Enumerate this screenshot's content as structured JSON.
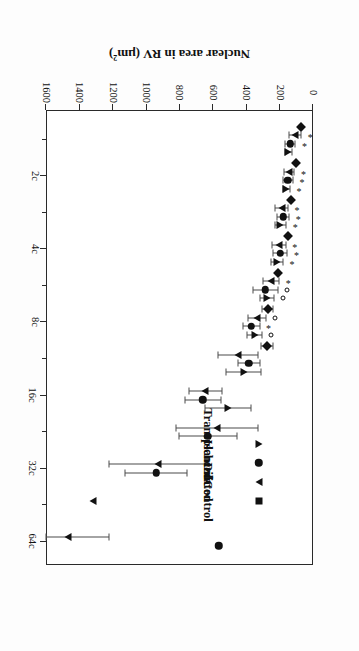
{
  "chart_data": {
    "type": "scatter",
    "title": "",
    "xlabel": "",
    "ylabel": "Nuclear area in RV (µm²)",
    "ylabel_html": "Nuclear area in RV (µm<sup>2</sup>)",
    "orientation": "figure printed rotated 180 degrees",
    "grid": false,
    "legend_position": "upper-left (in rotated frame)",
    "ylim": [
      0,
      1600
    ],
    "yticks": [
      0,
      200,
      400,
      600,
      800,
      1000,
      1200,
      1400,
      1600
    ],
    "ytick_labels": [
      "0",
      "200",
      "400",
      "600",
      "800",
      "1000",
      "1200",
      "1400",
      "1600"
    ],
    "xtick_labels": [
      "2c",
      "4c",
      "8c",
      "16c",
      "32c",
      "64c"
    ],
    "xtick_positions": [
      2,
      4,
      8,
      16,
      32,
      64
    ],
    "x_category_labels": [
      "1c",
      "2c",
      "3c",
      "4c",
      "6c",
      "8c",
      "12c",
      "16c",
      "24c",
      "32c",
      "48c",
      "64c"
    ],
    "error_bar_type": "SD",
    "annotation_legend": {
      "asterisk": "*",
      "open_circle": "o"
    },
    "series": [
      {
        "name": "Control",
        "marker": "diamond",
        "color": "#111111",
        "points": [
          {
            "class": "1c",
            "value": 72,
            "err": 0,
            "sig": ""
          },
          {
            "class": "2c",
            "value": 103,
            "err": 0,
            "sig": ""
          },
          {
            "class": "3c",
            "value": 130,
            "err": 0,
            "sig": ""
          },
          {
            "class": "4c",
            "value": 150,
            "err": 0,
            "sig": ""
          },
          {
            "class": "6c",
            "value": 212,
            "err": 0,
            "sig": ""
          },
          {
            "class": "8c",
            "value": 272,
            "err": 32,
            "sig": ""
          },
          {
            "class": "12c",
            "value": 275,
            "err": 35,
            "sig": ""
          }
        ]
      },
      {
        "name": "Dilated",
        "marker": "triangle-right",
        "color": "#111111",
        "points": [
          {
            "class": "1c",
            "value": 108,
            "err": 38,
            "sig": "*"
          },
          {
            "class": "2c",
            "value": 143,
            "err": 32,
            "sig": "*"
          },
          {
            "class": "3c",
            "value": 188,
            "err": 38,
            "sig": "*"
          },
          {
            "class": "4c",
            "value": 205,
            "err": 42,
            "sig": "*"
          },
          {
            "class": "6c",
            "value": 250,
            "err": 47,
            "sig": "*"
          },
          {
            "class": "8c",
            "value": 335,
            "err": 52,
            "sig": "o"
          },
          {
            "class": "12c",
            "value": 450,
            "err": 120,
            "sig": ""
          },
          {
            "class": "16c",
            "value": 645,
            "err": 100,
            "sig": ""
          },
          {
            "class": "24c",
            "value": 575,
            "err": 245,
            "sig": ""
          },
          {
            "class": "32c",
            "value": 930,
            "err": 290,
            "sig": ""
          },
          {
            "class": "48c",
            "value": 1320,
            "err": 0,
            "sig": ""
          },
          {
            "class": "64c",
            "value": 1470,
            "err": 245,
            "sig": ""
          }
        ]
      },
      {
        "name": "Ischemic",
        "marker": "circle",
        "color": "#111111",
        "points": [
          {
            "class": "1c",
            "value": 135,
            "err": 30,
            "sig": "*"
          },
          {
            "class": "2c",
            "value": 150,
            "err": 30,
            "sig": "*"
          },
          {
            "class": "3c",
            "value": 178,
            "err": 35,
            "sig": "*"
          },
          {
            "class": "4c",
            "value": 195,
            "err": 42,
            "sig": "*"
          },
          {
            "class": "6c",
            "value": 285,
            "err": 75,
            "sig": "o"
          },
          {
            "class": "8c",
            "value": 370,
            "err": 50,
            "sig": "*"
          },
          {
            "class": "12c",
            "value": 385,
            "err": 65,
            "sig": ""
          },
          {
            "class": "16c",
            "value": 660,
            "err": 110,
            "sig": ""
          },
          {
            "class": "24c",
            "value": 630,
            "err": 175,
            "sig": ""
          },
          {
            "class": "32c",
            "value": 940,
            "err": 185,
            "sig": ""
          },
          {
            "class": "64c",
            "value": 565,
            "err": 0,
            "sig": ""
          }
        ]
      },
      {
        "name": "Transplanted",
        "marker": "triangle-left",
        "color": "#111111",
        "points": [
          {
            "class": "1c",
            "value": 148,
            "err": 22,
            "sig": ""
          },
          {
            "class": "2c",
            "value": 160,
            "err": 22,
            "sig": "*"
          },
          {
            "class": "3c",
            "value": 195,
            "err": 35,
            "sig": "*"
          },
          {
            "class": "4c",
            "value": 215,
            "err": 35,
            "sig": "*"
          },
          {
            "class": "6c",
            "value": 275,
            "err": 42,
            "sig": "o"
          },
          {
            "class": "8c",
            "value": 350,
            "err": 45,
            "sig": "o"
          },
          {
            "class": "12c",
            "value": 415,
            "err": 105,
            "sig": ""
          },
          {
            "class": "16c",
            "value": 510,
            "err": 140,
            "sig": ""
          }
        ]
      }
    ]
  },
  "legend": {
    "items": [
      {
        "label": "Control",
        "marker": "diamond"
      },
      {
        "label": "Dilated",
        "marker": "triangle-right"
      },
      {
        "label": "Ischemic",
        "marker": "circle"
      },
      {
        "label": "Transplanted",
        "marker": "triangle-left"
      }
    ]
  },
  "axis": {
    "y_title": "Nuclear area in RV (µm²)"
  }
}
